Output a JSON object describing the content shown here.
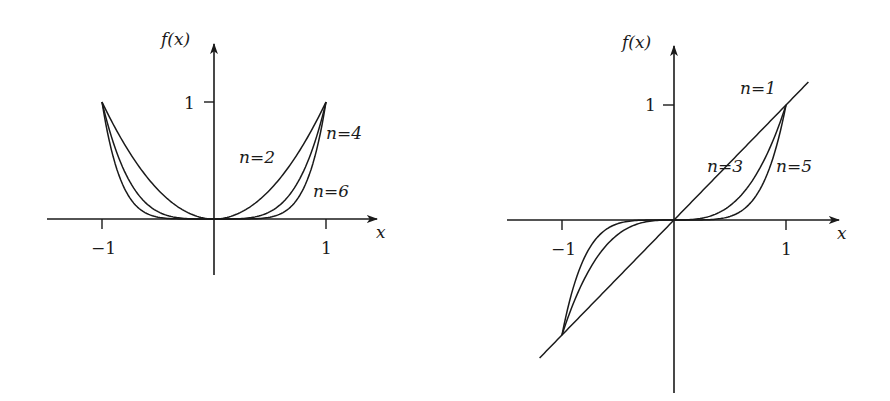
{
  "chart_data": [
    {
      "type": "line",
      "title": "",
      "xlabel": "x",
      "ylabel": "f(x)",
      "function": "f(x) = x^n (even n)",
      "xlim": [
        -1,
        1
      ],
      "ylim": [
        0,
        1
      ],
      "x_ticks": [
        {
          "value": -1,
          "label": "−1"
        },
        {
          "value": 1,
          "label": "1"
        }
      ],
      "y_ticks": [
        {
          "value": 1,
          "label": "1"
        }
      ],
      "grid": false,
      "legend": "inline labels",
      "x": [
        -1,
        -0.9,
        -0.8,
        -0.7,
        -0.6,
        -0.5,
        -0.4,
        -0.3,
        -0.2,
        -0.1,
        0,
        0.1,
        0.2,
        0.3,
        0.4,
        0.5,
        0.6,
        0.7,
        0.8,
        0.9,
        1
      ],
      "series": [
        {
          "name": "n=2",
          "exponent": 2,
          "values": [
            1,
            0.81,
            0.64,
            0.49,
            0.36,
            0.25,
            0.16,
            0.09,
            0.04,
            0.01,
            0,
            0.01,
            0.04,
            0.09,
            0.16,
            0.25,
            0.36,
            0.49,
            0.64,
            0.81,
            1
          ]
        },
        {
          "name": "n=4",
          "exponent": 4,
          "values": [
            1,
            0.656,
            0.41,
            0.24,
            0.13,
            0.063,
            0.026,
            0.008,
            0.002,
            0,
            0,
            0,
            0.002,
            0.008,
            0.026,
            0.063,
            0.13,
            0.24,
            0.41,
            0.656,
            1
          ]
        },
        {
          "name": "n=6",
          "exponent": 6,
          "values": [
            1,
            0.531,
            0.262,
            0.118,
            0.047,
            0.016,
            0.004,
            0.001,
            0,
            0,
            0,
            0,
            0,
            0.001,
            0.004,
            0.016,
            0.047,
            0.118,
            0.262,
            0.531,
            1
          ]
        }
      ],
      "annotations": [
        {
          "text": "n=2",
          "series": "n=2"
        },
        {
          "text": "n=4",
          "series": "n=4"
        },
        {
          "text": "n=6",
          "series": "n=6"
        }
      ]
    },
    {
      "type": "line",
      "title": "",
      "xlabel": "x",
      "ylabel": "f(x)",
      "function": "f(x) = x^n (odd n)",
      "xlim": [
        -1,
        1
      ],
      "ylim": [
        -1,
        1
      ],
      "x_ticks": [
        {
          "value": -1,
          "label": "−1"
        },
        {
          "value": 1,
          "label": "1"
        }
      ],
      "y_ticks": [
        {
          "value": 1,
          "label": "1"
        }
      ],
      "grid": false,
      "legend": "inline labels",
      "x": [
        -1,
        -0.9,
        -0.8,
        -0.7,
        -0.6,
        -0.5,
        -0.4,
        -0.3,
        -0.2,
        -0.1,
        0,
        0.1,
        0.2,
        0.3,
        0.4,
        0.5,
        0.6,
        0.7,
        0.8,
        0.9,
        1
      ],
      "series": [
        {
          "name": "n=1",
          "exponent": 1,
          "x_extent": [
            -1.2,
            1.2
          ],
          "values": [
            -1,
            -0.9,
            -0.8,
            -0.7,
            -0.6,
            -0.5,
            -0.4,
            -0.3,
            -0.2,
            -0.1,
            0,
            0.1,
            0.2,
            0.3,
            0.4,
            0.5,
            0.6,
            0.7,
            0.8,
            0.9,
            1
          ]
        },
        {
          "name": "n=3",
          "exponent": 3,
          "values": [
            -1,
            -0.729,
            -0.512,
            -0.343,
            -0.216,
            -0.125,
            -0.064,
            -0.027,
            -0.008,
            -0.001,
            0,
            0.001,
            0.008,
            0.027,
            0.064,
            0.125,
            0.216,
            0.343,
            0.512,
            0.729,
            1
          ]
        },
        {
          "name": "n=5",
          "exponent": 5,
          "values": [
            -1,
            -0.59,
            -0.328,
            -0.168,
            -0.078,
            -0.031,
            -0.01,
            -0.002,
            0,
            0,
            0,
            0,
            0,
            0.002,
            0.01,
            0.031,
            0.078,
            0.168,
            0.328,
            0.59,
            1
          ]
        }
      ],
      "annotations": [
        {
          "text": "n=1",
          "series": "n=1"
        },
        {
          "text": "n=3",
          "series": "n=3"
        },
        {
          "text": "n=5",
          "series": "n=5"
        }
      ]
    }
  ],
  "left": {
    "ylabel": "f(x)",
    "xlabel": "x",
    "tick_x_neg": "−1",
    "tick_x_pos": "1",
    "tick_y": "1",
    "labels": {
      "n2": "n=2",
      "n4": "n=4",
      "n6": "n=6"
    }
  },
  "right": {
    "ylabel": "f(x)",
    "xlabel": "x",
    "tick_x_neg": "−1",
    "tick_x_pos": "1",
    "tick_y": "1",
    "labels": {
      "n1": "n=1",
      "n3": "n=3",
      "n5": "n=5"
    }
  },
  "colors": {
    "ink": "#1a1a1a",
    "background": "#ffffff"
  }
}
